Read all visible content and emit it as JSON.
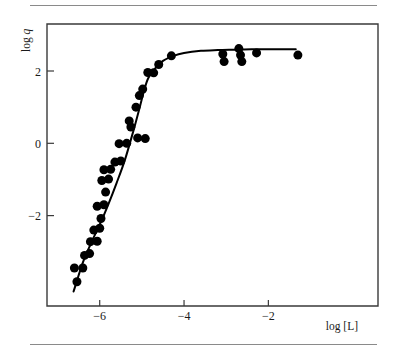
{
  "figure": {
    "name": "log-log-binding-saturation-plot",
    "background_color": "#ffffff",
    "ink_color": "#000000",
    "axis_color": "#3a3a3a",
    "rule_color": "#8a8a8a"
  },
  "axes": {
    "x": {
      "label": "log [L]",
      "ticks": [
        -6,
        -4,
        -2
      ],
      "tick_labels": [
        "−6",
        "−4",
        "−2"
      ],
      "range": [
        -7.25,
        0.6
      ]
    },
    "y": {
      "label_prefix": "log",
      "label_symbol": "q",
      "label": "log q",
      "ticks": [
        2,
        0,
        -2
      ],
      "tick_labels": [
        "2",
        "0",
        "−2"
      ],
      "range": [
        -4.5,
        3.3
      ]
    }
  },
  "chart_data": {
    "type": "scatter",
    "title": "",
    "xlabel": "log [L]",
    "ylabel": "log q",
    "xlim": [
      -7.25,
      0.6
    ],
    "ylim": [
      -4.5,
      3.3
    ],
    "xticks": [
      -6,
      -4,
      -2
    ],
    "yticks": [
      2,
      0,
      -2
    ],
    "grid": false,
    "legend": null,
    "series": [
      {
        "name": "measured points",
        "marker": "filled-circle",
        "marker_color": "#000000",
        "marker_size_px": 9,
        "points": [
          [
            -6.54,
            -3.83
          ],
          [
            -6.6,
            -3.45
          ],
          [
            -6.4,
            -3.45
          ],
          [
            -6.36,
            -3.1
          ],
          [
            -6.24,
            -3.05
          ],
          [
            -6.22,
            -2.72
          ],
          [
            -6.06,
            -2.71
          ],
          [
            -6.14,
            -2.4
          ],
          [
            -6.0,
            -2.35
          ],
          [
            -5.97,
            -2.08
          ],
          [
            -6.06,
            -1.74
          ],
          [
            -5.9,
            -1.7
          ],
          [
            -5.86,
            -1.35
          ],
          [
            -5.95,
            -1.03
          ],
          [
            -5.79,
            -0.99
          ],
          [
            -5.9,
            -0.73
          ],
          [
            -5.74,
            -0.72
          ],
          [
            -5.64,
            -0.52
          ],
          [
            -5.5,
            -0.49
          ],
          [
            -5.54,
            -0.01
          ],
          [
            -5.36,
            0.0
          ],
          [
            -5.3,
            0.62
          ],
          [
            -5.1,
            0.15
          ],
          [
            -5.26,
            0.45
          ],
          [
            -5.14,
            1.0
          ],
          [
            -5.06,
            1.32
          ],
          [
            -4.98,
            1.5
          ],
          [
            -4.86,
            1.96
          ],
          [
            -4.92,
            0.13
          ],
          [
            -4.72,
            1.95
          ],
          [
            -4.6,
            2.18
          ],
          [
            -4.3,
            2.42
          ],
          [
            -3.08,
            2.47
          ],
          [
            -3.05,
            2.26
          ],
          [
            -2.7,
            2.62
          ],
          [
            -2.66,
            2.44
          ],
          [
            -2.63,
            2.26
          ],
          [
            -2.28,
            2.5
          ],
          [
            -1.3,
            2.44
          ]
        ]
      }
    ],
    "fit_curve": {
      "name": "fitted saturation curve",
      "color": "#000000",
      "line_width_px": 2,
      "points": [
        [
          -6.62,
          -4.1
        ],
        [
          -6.4,
          -3.3
        ],
        [
          -6.2,
          -2.75
        ],
        [
          -6.0,
          -2.25
        ],
        [
          -5.8,
          -1.7
        ],
        [
          -5.6,
          -1.1
        ],
        [
          -5.4,
          -0.45
        ],
        [
          -5.2,
          0.35
        ],
        [
          -5.05,
          1.0
        ],
        [
          -4.95,
          1.45
        ],
        [
          -4.85,
          1.8
        ],
        [
          -4.7,
          2.05
        ],
        [
          -4.5,
          2.28
        ],
        [
          -4.25,
          2.42
        ],
        [
          -4.0,
          2.5
        ],
        [
          -3.6,
          2.56
        ],
        [
          -3.2,
          2.58
        ],
        [
          -2.8,
          2.59
        ],
        [
          -2.4,
          2.6
        ],
        [
          -2.0,
          2.6
        ],
        [
          -1.6,
          2.6
        ],
        [
          -1.35,
          2.6
        ]
      ]
    }
  }
}
